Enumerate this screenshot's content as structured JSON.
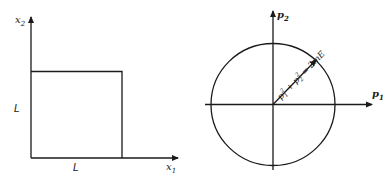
{
  "left_panel": {
    "title": "Configuration space (square box)",
    "x_axis_label": "x",
    "x_axis_subscript": "1",
    "y_axis_label": "x",
    "y_axis_subscript": "2",
    "side_label_horizontal": "L",
    "side_label_vertical": "L"
  },
  "right_panel": {
    "title": "Momentum space (circle)",
    "x_axis_label": "p",
    "x_axis_subscript": "1",
    "y_axis_label": "p",
    "y_axis_subscript": "2",
    "radius_equation": {
      "term1_base": "p",
      "term1_sub": "1",
      "term1_sup": "2",
      "plus": " + ",
      "term2_base": "p",
      "term2_sub": "2",
      "term2_sup": "2",
      "rhs": " = 2mE"
    }
  },
  "colors": {
    "stroke": "#1a1a1a",
    "background": "#ffffff"
  }
}
